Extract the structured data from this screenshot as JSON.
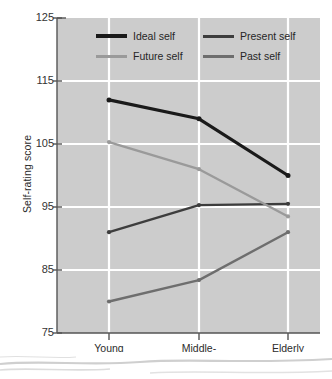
{
  "chart_data": {
    "type": "line",
    "title": "",
    "xlabel": "",
    "ylabel": "Self-rating score",
    "categories": [
      "Young adults",
      "Middle-aged adults",
      "Elderly adults"
    ],
    "category_lines": [
      [
        "Young",
        "adults"
      ],
      [
        "Middle-",
        "aged adults"
      ],
      [
        "Elderly",
        "adults"
      ]
    ],
    "ylim": [
      75,
      125
    ],
    "yticks": [
      125,
      115,
      105,
      95,
      85,
      75
    ],
    "ytick_labels": [
      "125",
      "115",
      "105",
      "95",
      "85",
      "75"
    ],
    "grid": "horizontal-and-vertical-white",
    "legend_position": "top-inside",
    "plot_background": "#cccccc",
    "series": [
      {
        "name": "Ideal self",
        "color": "#1a1a1a",
        "width": 3.2,
        "values": [
          112.0,
          109.0,
          100.0
        ]
      },
      {
        "name": "Present self",
        "color": "#3d3d3d",
        "width": 2.4,
        "values": [
          91.0,
          95.3,
          95.5
        ]
      },
      {
        "name": "Future self",
        "color": "#9a9a9a",
        "width": 2.4,
        "values": [
          105.3,
          101.0,
          93.5
        ]
      },
      {
        "name": "Past self",
        "color": "#6e6e6e",
        "width": 2.4,
        "values": [
          80.0,
          83.4,
          91.0
        ]
      }
    ]
  },
  "legend": {
    "items": [
      {
        "label": "Ideal self",
        "color": "#1a1a1a"
      },
      {
        "label": "Present self",
        "color": "#3d3d3d"
      },
      {
        "label": "Future self",
        "color": "#9a9a9a"
      },
      {
        "label": "Past self",
        "color": "#6e6e6e"
      }
    ]
  },
  "axes": {
    "y_title": "Self-rating score",
    "y_ticks": [
      "125",
      "115",
      "105",
      "95",
      "85",
      "75"
    ],
    "x_categories": [
      {
        "line1": "Young",
        "line2": "adults"
      },
      {
        "line1": "Middle-",
        "line2": "aged adults"
      },
      {
        "line1": "Elderly",
        "line2": "adults"
      }
    ]
  },
  "colors": {
    "plot_bg": "#cccccc",
    "grid": "#ffffff",
    "axis": "#555555",
    "text": "#2b2b2b"
  }
}
